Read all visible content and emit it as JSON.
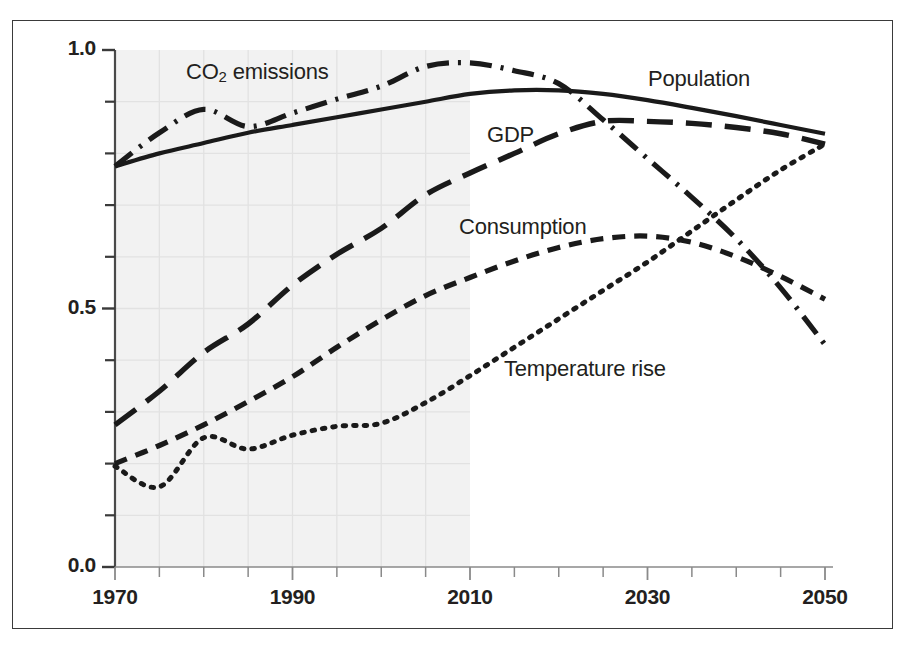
{
  "figure": {
    "background_color": "#ffffff",
    "frame_color": "#3a3a3a",
    "line_color": "#1a1a1a",
    "shaded_region_color": "#f2f2f2",
    "gridline_color": "#e2e2e2"
  },
  "axes": {
    "y_tick_labels": [
      "1.0",
      "0.5",
      "0.0"
    ],
    "y_tick_values": [
      1.0,
      0.5,
      0.0
    ],
    "y_minor_ticks": [
      0.1,
      0.2,
      0.3,
      0.4,
      0.6,
      0.7,
      0.8,
      0.9
    ],
    "x_tick_labels": [
      "1970",
      "1990",
      "2010",
      "2030",
      "2050"
    ],
    "x_tick_values": [
      1970,
      1990,
      2010,
      2030,
      2050
    ],
    "x_minor_step": 5
  },
  "series_labels": {
    "co2": {
      "text_main": "CO",
      "text_sub": "2",
      "text_tail": " emissions",
      "x": 186,
      "y": 59
    },
    "population": {
      "text": "Population",
      "x": 648,
      "y": 66
    },
    "gdp": {
      "text": "GDP",
      "x": 487,
      "y": 122
    },
    "consumption": {
      "text": "Consumption",
      "x": 459,
      "y": 214
    },
    "temperature": {
      "text": "Temperature rise",
      "x": 504,
      "y": 356
    }
  },
  "chart_data": {
    "type": "line",
    "title": "",
    "xlabel": "",
    "ylabel": "",
    "xlim": [
      1970,
      2050
    ],
    "ylim": [
      0.0,
      1.0
    ],
    "grid": true,
    "grid_region": [
      1970,
      2010
    ],
    "legend": "inline-annotations",
    "annotations": [
      "CO2 emissions",
      "Population",
      "GDP",
      "Consumption",
      "Temperature rise"
    ],
    "x": [
      1970,
      1975,
      1980,
      1985,
      1990,
      1995,
      2000,
      2005,
      2010,
      2015,
      2020,
      2025,
      2030,
      2035,
      2040,
      2045,
      2050
    ],
    "series": [
      {
        "name": "Population",
        "dash": "solid",
        "values": [
          0.775,
          0.8,
          0.82,
          0.84,
          0.855,
          0.87,
          0.885,
          0.9,
          0.915,
          0.922,
          0.922,
          0.915,
          0.903,
          0.888,
          0.872,
          0.855,
          0.838
        ]
      },
      {
        "name": "CO2 emissions",
        "dash": "dashdot",
        "values": [
          0.775,
          0.84,
          0.885,
          0.852,
          0.878,
          0.905,
          0.93,
          0.968,
          0.975,
          0.96,
          0.935,
          0.865,
          0.79,
          0.715,
          0.635,
          0.54,
          0.43
        ]
      },
      {
        "name": "GDP",
        "dash": "longdash",
        "values": [
          0.275,
          0.34,
          0.415,
          0.47,
          0.545,
          0.605,
          0.655,
          0.72,
          0.762,
          0.8,
          0.838,
          0.862,
          0.862,
          0.858,
          0.85,
          0.838,
          0.818
        ]
      },
      {
        "name": "Consumption",
        "dash": "dashed",
        "values": [
          0.2,
          0.235,
          0.275,
          0.32,
          0.368,
          0.425,
          0.478,
          0.525,
          0.56,
          0.592,
          0.618,
          0.635,
          0.64,
          0.628,
          0.6,
          0.562,
          0.518
        ]
      },
      {
        "name": "Temperature rise",
        "dash": "dotted",
        "values": [
          0.195,
          0.155,
          0.25,
          0.228,
          0.255,
          0.272,
          0.278,
          0.318,
          0.37,
          0.425,
          0.48,
          0.535,
          0.59,
          0.65,
          0.71,
          0.768,
          0.818
        ]
      }
    ]
  }
}
